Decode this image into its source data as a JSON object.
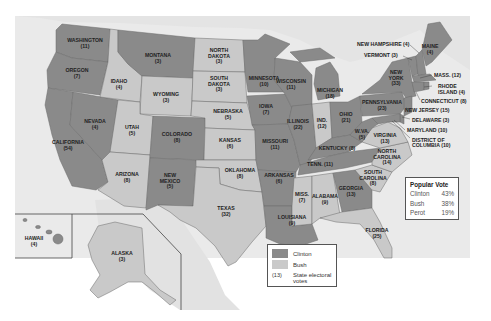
{
  "colors": {
    "clinton": "#8a8a8a",
    "bush": "#c9c9c9",
    "water": "#e9e9e9",
    "land_other": "#dcdcdc",
    "border": "#6a6a6a",
    "background": "#ffffff"
  },
  "legend": {
    "items": [
      {
        "label": "Clinton",
        "swatch": "clinton"
      },
      {
        "label": "Bush",
        "swatch": "bush"
      }
    ],
    "ev_sample": "(13)",
    "ev_label_line1": "State electoral",
    "ev_label_line2": "votes"
  },
  "popular_vote": {
    "title": "Popular Vote",
    "rows": [
      {
        "candidate": "Clinton",
        "pct": "43%"
      },
      {
        "candidate": "Bush",
        "pct": "38%"
      },
      {
        "candidate": "Perot",
        "pct": "19%"
      }
    ]
  },
  "states": [
    {
      "name": "WASHINGTON",
      "ev": "(11)",
      "winner": "clinton"
    },
    {
      "name": "OREGON",
      "ev": "(7)",
      "winner": "clinton"
    },
    {
      "name": "CALIFORNIA",
      "ev": "(54)",
      "winner": "clinton"
    },
    {
      "name": "NEVADA",
      "ev": "(4)",
      "winner": "clinton"
    },
    {
      "name": "IDAHO",
      "ev": "(4)",
      "winner": "bush"
    },
    {
      "name": "MONTANA",
      "ev": "(3)",
      "winner": "clinton"
    },
    {
      "name": "WYOMING",
      "ev": "(3)",
      "winner": "bush"
    },
    {
      "name": "UTAH",
      "ev": "(5)",
      "winner": "bush"
    },
    {
      "name": "ARIZONA",
      "ev": "(8)",
      "winner": "bush"
    },
    {
      "name": "COLORADO",
      "ev": "(8)",
      "winner": "clinton"
    },
    {
      "name": "NEW MEXICO",
      "ev": "(5)",
      "winner": "clinton"
    },
    {
      "name": "NORTH DAKOTA",
      "ev": "(3)",
      "winner": "bush"
    },
    {
      "name": "SOUTH DAKOTA",
      "ev": "(3)",
      "winner": "bush"
    },
    {
      "name": "NEBRASKA",
      "ev": "(5)",
      "winner": "bush"
    },
    {
      "name": "KANSAS",
      "ev": "(6)",
      "winner": "bush"
    },
    {
      "name": "OKLAHOMA",
      "ev": "(8)",
      "winner": "bush"
    },
    {
      "name": "TEXAS",
      "ev": "(32)",
      "winner": "bush"
    },
    {
      "name": "MINNESOTA",
      "ev": "(10)",
      "winner": "clinton"
    },
    {
      "name": "IOWA",
      "ev": "(7)",
      "winner": "clinton"
    },
    {
      "name": "MISSOURI",
      "ev": "(11)",
      "winner": "clinton"
    },
    {
      "name": "ARKANSAS",
      "ev": "(6)",
      "winner": "clinton"
    },
    {
      "name": "LOUISIANA",
      "ev": "(9)",
      "winner": "clinton"
    },
    {
      "name": "WISCONSIN",
      "ev": "(11)",
      "winner": "clinton"
    },
    {
      "name": "ILLINOIS",
      "ev": "(22)",
      "winner": "clinton"
    },
    {
      "name": "MICHIGAN",
      "ev": "(18)",
      "winner": "clinton"
    },
    {
      "name": "IND.",
      "ev": "(12)",
      "winner": "bush"
    },
    {
      "name": "OHIO",
      "ev": "(21)",
      "winner": "clinton"
    },
    {
      "name": "KENTUCKY",
      "ev": "(8)",
      "winner": "clinton"
    },
    {
      "name": "TENN.",
      "ev": "(11)",
      "winner": "clinton"
    },
    {
      "name": "MISS.",
      "ev": "(7)",
      "winner": "bush"
    },
    {
      "name": "ALABAMA",
      "ev": "(9)",
      "winner": "bush"
    },
    {
      "name": "GEORGIA",
      "ev": "(13)",
      "winner": "clinton"
    },
    {
      "name": "FLORIDA",
      "ev": "(25)",
      "winner": "bush"
    },
    {
      "name": "SOUTH CAROLINA",
      "ev": "(8)",
      "winner": "bush"
    },
    {
      "name": "NORTH CAROLINA",
      "ev": "(14)",
      "winner": "bush"
    },
    {
      "name": "VIRGINIA",
      "ev": "(13)",
      "winner": "bush"
    },
    {
      "name": "W.VA.",
      "ev": "(5)",
      "winner": "clinton"
    },
    {
      "name": "PENNSYLVANIA",
      "ev": "(23)",
      "winner": "clinton"
    },
    {
      "name": "NEW YORK",
      "ev": "(33)",
      "winner": "clinton"
    },
    {
      "name": "VERMONT",
      "ev": "(3)",
      "winner": "clinton"
    },
    {
      "name": "NEW HAMPSHIRE",
      "ev": "(4)",
      "winner": "clinton"
    },
    {
      "name": "MAINE",
      "ev": "(4)",
      "winner": "clinton"
    },
    {
      "name": "MASS.",
      "ev": "(12)",
      "winner": "clinton"
    },
    {
      "name": "RHODE ISLAND",
      "ev": "(4)",
      "winner": "clinton"
    },
    {
      "name": "CONNECTICUT",
      "ev": "(8)",
      "winner": "clinton"
    },
    {
      "name": "NEW JERSEY",
      "ev": "(15)",
      "winner": "clinton"
    },
    {
      "name": "DELAWARE",
      "ev": "(3)",
      "winner": "clinton"
    },
    {
      "name": "MARYLAND",
      "ev": "(10)",
      "winner": "clinton"
    },
    {
      "name": "DISTRICT OF COLUMBIA",
      "ev": "(3)",
      "winner": "clinton"
    },
    {
      "name": "ALASKA",
      "ev": "(3)",
      "winner": "bush"
    },
    {
      "name": "HAWAII",
      "ev": "(4)",
      "winner": "clinton"
    }
  ],
  "labels": {
    "wa": [
      "WASHINGTON",
      "(11)"
    ],
    "or": [
      "OREGON",
      "(7)"
    ],
    "ca": [
      "CALIFORNIA",
      "(54)"
    ],
    "nv": [
      "NEVADA",
      "(4)"
    ],
    "id": [
      "IDAHO",
      "(4)"
    ],
    "mt": [
      "MONTANA",
      "(3)"
    ],
    "wy": [
      "WYOMING",
      "(3)"
    ],
    "ut": [
      "UTAH",
      "(5)"
    ],
    "az": [
      "ARIZONA",
      "(8)"
    ],
    "co": [
      "COLORADO",
      "(8)"
    ],
    "nm": [
      "NEW",
      "MEXICO",
      "(5)"
    ],
    "nd": [
      "NORTH",
      "DAKOTA",
      "(3)"
    ],
    "sd": [
      "SOUTH",
      "DAKOTA",
      "(3)"
    ],
    "ne": [
      "NEBRASKA",
      "(5)"
    ],
    "ks": [
      "KANSAS",
      "(6)"
    ],
    "ok": [
      "OKLAHOMA",
      "(8)"
    ],
    "tx": [
      "TEXAS",
      "(32)"
    ],
    "mn": [
      "MINNESOTA",
      "(10)"
    ],
    "ia": [
      "IOWA",
      "(7)"
    ],
    "mo": [
      "MISSOURI",
      "(11)"
    ],
    "ar": [
      "ARKANSAS",
      "(6)"
    ],
    "la": [
      "LOUISIANA",
      "(9)"
    ],
    "wi": [
      "WISCONSIN",
      "(11)"
    ],
    "il": [
      "ILLINOIS",
      "(22)"
    ],
    "mi": [
      "MICHIGAN",
      "(18)"
    ],
    "in": [
      "IND.",
      "(12)"
    ],
    "oh": [
      "OHIO",
      "(21)"
    ],
    "ky": [
      "KENTUCKY (8)"
    ],
    "tn": [
      "TENN. (11)"
    ],
    "ms": [
      "MISS.",
      "(7)"
    ],
    "al": [
      "ALABAMA",
      "(9)"
    ],
    "ga": [
      "GEORGIA",
      "(13)"
    ],
    "fl": [
      "FLORIDA",
      "(25)"
    ],
    "sc": [
      "SOUTH",
      "CAROLINA",
      "(8)"
    ],
    "nc": [
      "NORTH",
      "CAROLINA",
      "(14)"
    ],
    "va": [
      "VIRGINIA",
      "(13)"
    ],
    "wv": [
      "W.VA.",
      "(5)"
    ],
    "pa": [
      "PENNSYLVANIA",
      "(23)"
    ],
    "ny": [
      "NEW",
      "YORK",
      "(33)"
    ],
    "me": [
      "MAINE",
      "(4)"
    ],
    "ak": [
      "ALASKA",
      "(3)"
    ],
    "hi": [
      "HAWAII",
      "(4)"
    ],
    "nh": "NEW HAMPSHIRE (4)",
    "vt": "VERMONT (3)",
    "ma": "MASS. (12)",
    "ri1": "RHODE",
    "ri2": "ISLAND (4)",
    "ct": "CONNECTICUT (8)",
    "nj": "NEW JERSEY (15)",
    "de": "DELAWARE (3)",
    "md": "MARYLAND (10)",
    "dc1": "DISTRICT OF",
    "dc2": "COLUMBIA (10)"
  }
}
